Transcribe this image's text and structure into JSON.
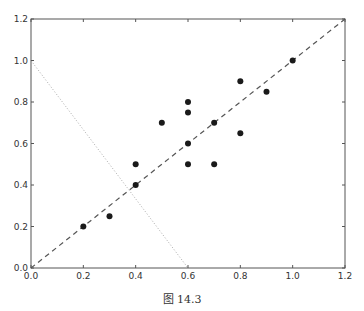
{
  "figure": {
    "caption": "图 14.3"
  },
  "colors": {
    "axes": "#555555",
    "points": "#1a1a1a",
    "dashed_line": "#555555",
    "dotted_line": "#aaaaaa",
    "tick_text": "#333333"
  },
  "chart_data": {
    "type": "scatter",
    "title": "",
    "xlabel": "",
    "ylabel": "",
    "xlim": [
      0.0,
      1.2
    ],
    "ylim": [
      0.0,
      1.2
    ],
    "grid": false,
    "legend": null,
    "x_ticks": [
      "0.0",
      "0.2",
      "0.4",
      "0.6",
      "0.8",
      "1.0",
      "1.2"
    ],
    "y_ticks": [
      "0.0",
      "0.2",
      "0.4",
      "0.6",
      "0.8",
      "1.0",
      "1.2"
    ],
    "series": [
      {
        "name": "points",
        "type": "scatter",
        "x": [
          0.2,
          0.3,
          0.4,
          0.4,
          0.5,
          0.6,
          0.6,
          0.6,
          0.6,
          0.7,
          0.7,
          0.8,
          0.8,
          0.9,
          1.0
        ],
        "y": [
          0.2,
          0.25,
          0.4,
          0.5,
          0.7,
          0.5,
          0.6,
          0.75,
          0.8,
          0.5,
          0.7,
          0.65,
          0.9,
          0.85,
          1.0
        ]
      },
      {
        "name": "dashed line y = x",
        "type": "line",
        "style": "dashed",
        "x": [
          0.0,
          1.2
        ],
        "y": [
          0.0,
          1.2
        ]
      },
      {
        "name": "dotted line",
        "type": "line",
        "style": "dotted",
        "x": [
          0.0,
          0.6
        ],
        "y": [
          1.0,
          0.0
        ]
      }
    ],
    "caption": "图 14.3"
  }
}
